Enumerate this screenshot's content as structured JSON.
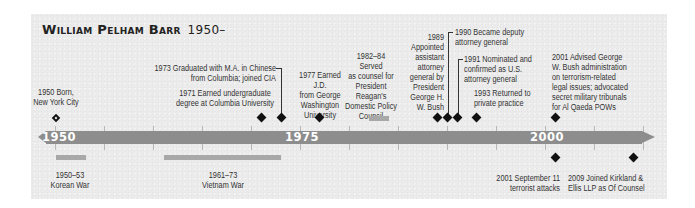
{
  "title": {
    "name": "William Pelham Barr",
    "years": "1950–"
  },
  "axis": {
    "labels": [
      {
        "year": 1950,
        "text": "1950"
      },
      {
        "year": 1975,
        "text": "1975"
      },
      {
        "year": 2000,
        "text": "2000"
      }
    ],
    "start_year": 1947,
    "end_year": 2012,
    "tick_interval_years": 5
  },
  "events_above": [
    {
      "year": 1950,
      "marker": "born-diamond",
      "lines": [
        "1950 Born,",
        "New York City"
      ]
    },
    {
      "year": 1971,
      "marker": "diamond",
      "lines": [
        "1971 Earned undergraduate",
        "degree at Columbia University"
      ]
    },
    {
      "year": 1973,
      "marker": "diamond",
      "lines": [
        "1973 Graduated with M.A. in Chinese",
        "from Columbia; joined CIA"
      ]
    },
    {
      "year": 1977,
      "marker": "diamond",
      "lines": [
        "1977 Earned J.D.",
        "from George",
        "Washington",
        "University"
      ]
    },
    {
      "year": "1982–84",
      "marker": "span",
      "lines": [
        "1982–84 Served",
        "as counsel for",
        "President",
        "Reagan's",
        "Domestic Policy",
        "Council"
      ]
    },
    {
      "year": 1989,
      "marker": "diamond",
      "lines": [
        "1989",
        "Appointed",
        "assistant",
        "attorney",
        "general by",
        "President",
        "George H.",
        "W. Bush"
      ]
    },
    {
      "year": 1990,
      "marker": "diamond",
      "lines": [
        "1990 Became deputy",
        "attorney general"
      ]
    },
    {
      "year": 1991,
      "marker": "diamond",
      "lines": [
        "1991 Nominated and",
        "confirmed as U.S.",
        "attorney general"
      ]
    },
    {
      "year": 1993,
      "marker": "diamond",
      "lines": [
        "1993 Returned to",
        "private practice"
      ]
    },
    {
      "year": 2001,
      "marker": "diamond",
      "lines": [
        "2001 Advised George",
        "W. Bush administration",
        "on terrorism-related",
        "legal issues; advocated",
        "secret military tribunals",
        "for Al Qaeda POWs"
      ]
    }
  ],
  "events_below": [
    {
      "year": "1950–53",
      "marker": "span",
      "lines": [
        "1950–53",
        "Korean War"
      ]
    },
    {
      "year": "1961–73",
      "marker": "span",
      "lines": [
        "1961–73",
        "Vietnam War"
      ]
    },
    {
      "year": 2001,
      "marker": "diamond",
      "lines": [
        "2001 September 11",
        "terrorist attacks"
      ]
    },
    {
      "year": 2009,
      "marker": "diamond",
      "lines": [
        "2009 Joined Kirkland &",
        "Ellis LLP as Of Counsel"
      ]
    }
  ],
  "colors": {
    "panel_bg": "#ebebeb",
    "axis_bar": "#8d8d8d",
    "span_bar": "#a8a8a8",
    "marker": "#111111",
    "text": "#333333"
  }
}
